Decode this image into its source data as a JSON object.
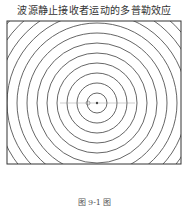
{
  "title": "波源静止接收者运动的多普勒效应",
  "caption": "图 9-1 图",
  "diagram": {
    "frame": {
      "x": 7,
      "y": 21,
      "width": 174,
      "height": 143
    },
    "center": {
      "x": 97,
      "y": 103
    },
    "ring_spacing": 10,
    "ring_count": 14,
    "receiver": {
      "x": 88,
      "y": 103
    },
    "line_color": "#555555"
  }
}
